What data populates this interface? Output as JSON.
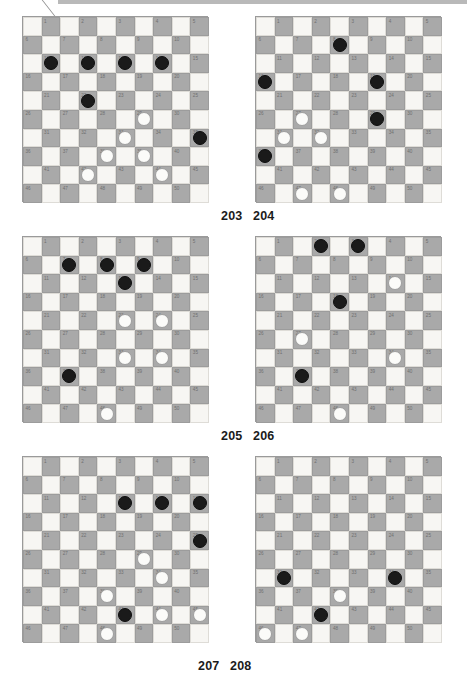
{
  "page": {
    "type": "draughts-puzzle-sheet",
    "board_size": 10,
    "numbered_squares": 50,
    "colors": {
      "dark_square": "#a9a9a9",
      "light_square": "#f7f6f3",
      "black_piece": "#1a1a1a",
      "white_piece": "#fbfbf9",
      "square_number": "#6f6f6f",
      "caption": "#1b1b1b"
    }
  },
  "square_numbers": [
    "1",
    "2",
    "3",
    "4",
    "5",
    "6",
    "7",
    "8",
    "9",
    "10",
    "11",
    "12",
    "13",
    "14",
    "15",
    "16",
    "17",
    "18",
    "19",
    "20",
    "21",
    "22",
    "23",
    "24",
    "25",
    "26",
    "27",
    "28",
    "29",
    "30",
    "31",
    "32",
    "33",
    "34",
    "35",
    "36",
    "37",
    "38",
    "39",
    "40",
    "41",
    "42",
    "43",
    "44",
    "45",
    "46",
    "47",
    "48",
    "49",
    "50"
  ],
  "diagrams": [
    {
      "caption": "203",
      "caption_position": "left",
      "black": [
        11,
        12,
        13,
        14,
        22,
        35
      ],
      "white": [
        29,
        33,
        38,
        39,
        42,
        44
      ]
    },
    {
      "caption": "204",
      "caption_position": "right",
      "black": [
        8,
        16,
        19,
        29,
        36
      ],
      "white": [
        27,
        31,
        32,
        47,
        48
      ]
    },
    {
      "caption": "205",
      "caption_position": "left",
      "black": [
        7,
        8,
        9,
        13,
        37
      ],
      "white": [
        23,
        24,
        33,
        34,
        48
      ]
    },
    {
      "caption": "206",
      "caption_position": "right",
      "black": [
        2,
        3,
        18,
        37
      ],
      "white": [
        14,
        27,
        34,
        48
      ]
    },
    {
      "caption": "207",
      "caption_position": "left",
      "black": [
        13,
        14,
        15,
        25,
        43
      ],
      "white": [
        29,
        34,
        38,
        44,
        45,
        48
      ]
    },
    {
      "caption": "208",
      "caption_position": "right",
      "black": [
        31,
        34,
        42
      ],
      "white": [
        38,
        46,
        47
      ]
    }
  ],
  "captions_row_layout": [
    {
      "left_label": "203",
      "right_label": "204"
    },
    {
      "left_label": "205",
      "right_label": "206"
    },
    {
      "left_label": "207",
      "right_label": "208"
    }
  ]
}
